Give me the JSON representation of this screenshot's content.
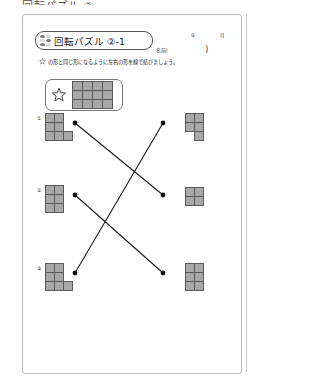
{
  "page": {
    "cropped_header_title": "回転パズル ②",
    "worksheet_title": "回転パズル ②-1",
    "name_label": "名前(",
    "name_close": ")",
    "date_fields": [
      "年",
      "月",
      "日"
    ],
    "instruction": "の形と同じ形になるように左右の形を線で結びましょう。",
    "instruction_star_icon": "star-icon",
    "braille_icon": "braille-dots-icon"
  },
  "example": {
    "star_icon": "star-icon",
    "shape": {
      "name": "example-grid-4x3",
      "cols": 4,
      "rows": 3,
      "cells": [
        [
          1,
          1,
          1,
          1
        ],
        [
          1,
          1,
          1,
          1
        ],
        [
          1,
          1,
          1,
          1
        ]
      ]
    }
  },
  "left_items": [
    {
      "number": "①",
      "shape_name": "left-shape-1",
      "cols": 3,
      "rows": 3,
      "cells": [
        [
          1,
          1,
          0
        ],
        [
          1,
          1,
          0
        ],
        [
          1,
          1,
          1
        ]
      ]
    },
    {
      "number": "②",
      "shape_name": "left-shape-2",
      "cols": 2,
      "rows": 3,
      "cells": [
        [
          1,
          1
        ],
        [
          1,
          1
        ],
        [
          1,
          1
        ]
      ]
    },
    {
      "number": "③",
      "shape_name": "left-shape-3",
      "cols": 3,
      "rows": 3,
      "cells": [
        [
          1,
          1,
          0
        ],
        [
          1,
          1,
          0
        ],
        [
          1,
          1,
          1
        ]
      ]
    }
  ],
  "right_items": [
    {
      "shape_name": "right-shape-a",
      "cols": 2,
      "rows": 3,
      "cells": [
        [
          1,
          1
        ],
        [
          1,
          1
        ],
        [
          0,
          1
        ]
      ]
    },
    {
      "shape_name": "right-shape-b",
      "cols": 2,
      "rows": 2,
      "cells": [
        [
          1,
          1
        ],
        [
          1,
          1
        ]
      ]
    },
    {
      "shape_name": "right-shape-c",
      "cols": 2,
      "rows": 3,
      "cells": [
        [
          1,
          1
        ],
        [
          1,
          1
        ],
        [
          1,
          1
        ]
      ]
    }
  ],
  "connections": [
    {
      "name": "line-left1-to-right2",
      "from": "left-dot-1",
      "to": "right-dot-2"
    },
    {
      "name": "line-left2-to-right3",
      "from": "left-dot-2",
      "to": "right-dot-3"
    },
    {
      "name": "line-left3-to-right1",
      "from": "left-dot-3",
      "to": "right-dot-1"
    }
  ],
  "dots": {
    "left": [
      {
        "x": 52,
        "y": 108
      },
      {
        "x": 52,
        "y": 180
      },
      {
        "x": 52,
        "y": 258
      }
    ],
    "right": [
      {
        "x": 140,
        "y": 108
      },
      {
        "x": 140,
        "y": 180
      },
      {
        "x": 140,
        "y": 258
      }
    ]
  },
  "colors": {
    "cell_fill": "#a8a8a8",
    "cell_border": "#5a5a5a",
    "line": "#1a1a1a",
    "sheet_border": "#b9b9b9"
  }
}
